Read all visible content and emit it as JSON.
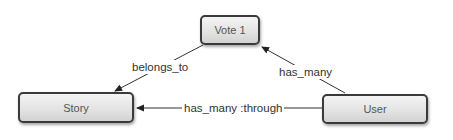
{
  "diagram": {
    "nodes": [
      {
        "id": "vote",
        "label": "Vote 1"
      },
      {
        "id": "story",
        "label": "Story"
      },
      {
        "id": "user",
        "label": "User"
      }
    ],
    "edges": [
      {
        "from": "vote",
        "to": "story",
        "label": "belongs_to"
      },
      {
        "from": "user",
        "to": "vote",
        "label": "has_many"
      },
      {
        "from": "user",
        "to": "story",
        "label": "has_many :through"
      }
    ],
    "colors": {
      "node_border": "#3a3a3a",
      "node_fill_top": "#f4f4f4",
      "node_fill_bottom": "#d2d2d2",
      "edge": "#333333",
      "text": "#555555"
    }
  }
}
